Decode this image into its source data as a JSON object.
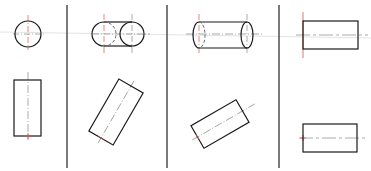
{
  "diagram": {
    "type": "orthographic-projection-cylinder",
    "columns": 4,
    "colors": {
      "outline": "#1a1a1a",
      "divider": "#333333",
      "centerline_red": "#d9534f",
      "centerline_gray": "#888888",
      "reference_line": "#dcdcdc",
      "background": "#ffffff"
    },
    "panels": [
      {
        "id": "panel-1",
        "top_view": "circle end view",
        "bottom_view": "vertical rectangle"
      },
      {
        "id": "panel-2",
        "top_view": "capsule (two overlapping circles with hidden arc)",
        "bottom_view": "rectangle rotated ~30°"
      },
      {
        "id": "panel-3",
        "top_view": "cylinder with ellipse ends (hidden arc on left)",
        "bottom_view": "rectangle rotated ~-30°"
      },
      {
        "id": "panel-4",
        "top_view": "horizontal rectangle",
        "bottom_view": "horizontal rectangle"
      }
    ]
  }
}
